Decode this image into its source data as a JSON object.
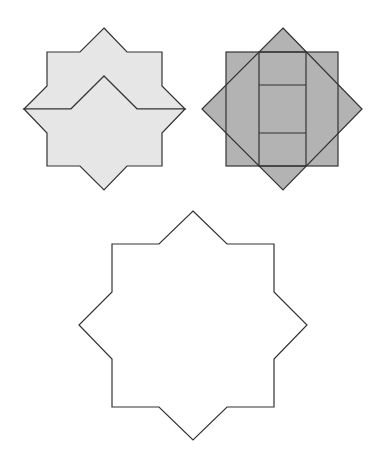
{
  "diagram": {
    "colors": {
      "light_fill": "#e6e6e6",
      "dark_fill": "#b3b3b3",
      "outline_fill": "#ffffff",
      "stroke": "#333333"
    },
    "figures": [
      {
        "id": "star-split-into-two-pieces",
        "fill": "light"
      },
      {
        "id": "square-diamond-overlay",
        "fill": "dark"
      },
      {
        "id": "star-outline",
        "fill": "none"
      }
    ]
  }
}
